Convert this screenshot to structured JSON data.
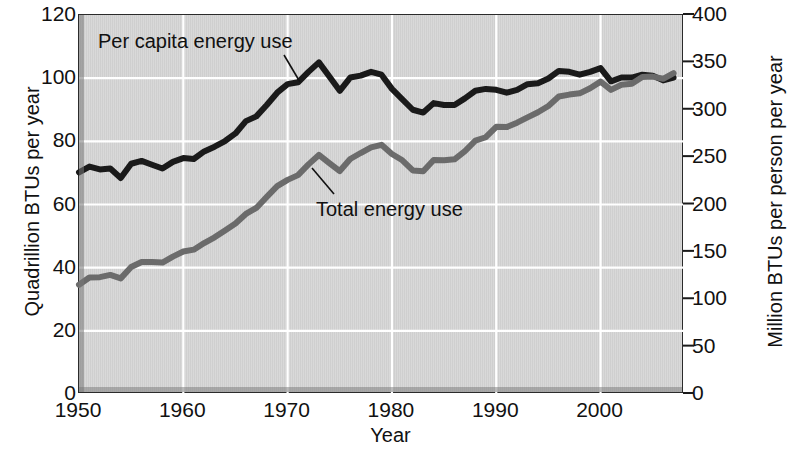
{
  "chart_data": {
    "type": "line",
    "title": "",
    "xlabel": "Year",
    "ylabel": "Quadrillion BTUs per year",
    "y2label": "Million BTUs per person per year",
    "xlim": [
      1950,
      2008
    ],
    "ylim": [
      0,
      120
    ],
    "y2lim": [
      0,
      400
    ],
    "grid": true,
    "legend_position": "inline-annotations",
    "xticks": [
      "1950",
      "1960",
      "1970",
      "1980",
      "1990",
      "2000"
    ],
    "xtick_values": [
      1950,
      1960,
      1970,
      1980,
      1990,
      2000
    ],
    "yticks": [
      "0",
      "20",
      "40",
      "60",
      "80",
      "100",
      "120"
    ],
    "ytick_values": [
      0,
      20,
      40,
      60,
      80,
      100,
      120
    ],
    "y2ticks": [
      "0",
      "50",
      "100",
      "150",
      "200",
      "250",
      "300",
      "350",
      "400"
    ],
    "y2tick_values": [
      0,
      50,
      100,
      150,
      200,
      250,
      300,
      350,
      400
    ],
    "annotations": [
      {
        "label": "Per capita energy use",
        "series": "Per capita energy use"
      },
      {
        "label": "Total energy use",
        "series": "Total energy use"
      }
    ],
    "series": [
      {
        "name": "Per capita energy use",
        "axis": "right",
        "units": "Million BTUs per person per year",
        "color": "#1a1a1a",
        "x": [
          1950,
          1951,
          1952,
          1953,
          1954,
          1955,
          1956,
          1957,
          1958,
          1959,
          1960,
          1961,
          1962,
          1963,
          1964,
          1965,
          1966,
          1967,
          1968,
          1969,
          1970,
          1971,
          1972,
          1973,
          1974,
          1975,
          1976,
          1977,
          1978,
          1979,
          1980,
          1981,
          1982,
          1983,
          1984,
          1985,
          1986,
          1987,
          1988,
          1989,
          1990,
          1991,
          1992,
          1993,
          1994,
          1995,
          1996,
          1997,
          1998,
          1999,
          2000,
          2001,
          2002,
          2003,
          2004,
          2005,
          2006,
          2007
        ],
        "values": [
          234,
          240,
          237,
          238,
          228,
          243,
          246,
          242,
          238,
          245,
          249,
          248,
          256,
          261,
          267,
          275,
          288,
          293,
          305,
          318,
          327,
          329,
          340,
          350,
          335,
          320,
          334,
          336,
          340,
          337,
          322,
          311,
          300,
          297,
          307,
          305,
          305,
          312,
          320,
          322,
          321,
          318,
          321,
          327,
          328,
          333,
          341,
          340,
          337,
          340,
          344,
          330,
          334,
          334,
          337,
          336,
          331,
          334
        ]
      },
      {
        "name": "Total energy use",
        "axis": "left",
        "units": "Quadrillion BTUs per year",
        "color": "#6b6b6b",
        "x": [
          1950,
          1951,
          1952,
          1953,
          1954,
          1955,
          1956,
          1957,
          1958,
          1959,
          1960,
          1961,
          1962,
          1963,
          1964,
          1965,
          1966,
          1967,
          1968,
          1969,
          1970,
          1971,
          1972,
          1973,
          1974,
          1975,
          1976,
          1977,
          1978,
          1979,
          1980,
          1981,
          1982,
          1983,
          1984,
          1985,
          1986,
          1987,
          1988,
          1989,
          1990,
          1991,
          1992,
          1993,
          1994,
          1995,
          1996,
          1997,
          1998,
          1999,
          2000,
          2001,
          2002,
          2003,
          2004,
          2005,
          2006,
          2007
        ],
        "values": [
          34.6,
          36.9,
          37.0,
          37.7,
          36.6,
          40.2,
          41.8,
          41.8,
          41.6,
          43.5,
          45.1,
          45.7,
          47.8,
          49.6,
          51.8,
          54.0,
          57.0,
          58.9,
          62.4,
          65.8,
          67.8,
          69.3,
          72.7,
          75.7,
          73.1,
          70.6,
          74.4,
          76.3,
          78.1,
          78.9,
          76.0,
          74.0,
          70.8,
          70.5,
          74.1,
          74.0,
          74.3,
          76.9,
          80.2,
          81.3,
          84.6,
          84.5,
          85.9,
          87.6,
          89.2,
          91.2,
          94.2,
          94.8,
          95.2,
          96.8,
          98.9,
          96.3,
          97.9,
          98.2,
          100.4,
          100.5,
          99.8,
          101.6
        ]
      }
    ]
  }
}
